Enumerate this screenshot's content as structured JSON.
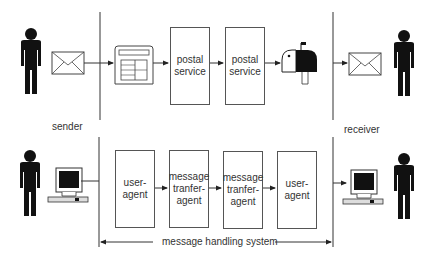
{
  "labels": {
    "sender": "sender",
    "receiver": "receiver",
    "system": "message handling system"
  },
  "postal_row": {
    "boxes": [
      {
        "text": "postal\nservice"
      },
      {
        "text": "postal\nservice"
      }
    ],
    "icons": [
      "person-icon",
      "envelope-icon",
      "letter-sorting-icon",
      "mailbox-icon",
      "envelope-icon",
      "person-icon"
    ]
  },
  "electronic_row": {
    "boxes": [
      {
        "text": "user-\nagent"
      },
      {
        "text": "message\ntranfer-\nagent"
      },
      {
        "text": "message\ntranfer-\nagent"
      },
      {
        "text": "user-\nagent"
      }
    ],
    "icons": [
      "person-icon",
      "computer-icon",
      "computer-icon",
      "person-icon"
    ]
  }
}
